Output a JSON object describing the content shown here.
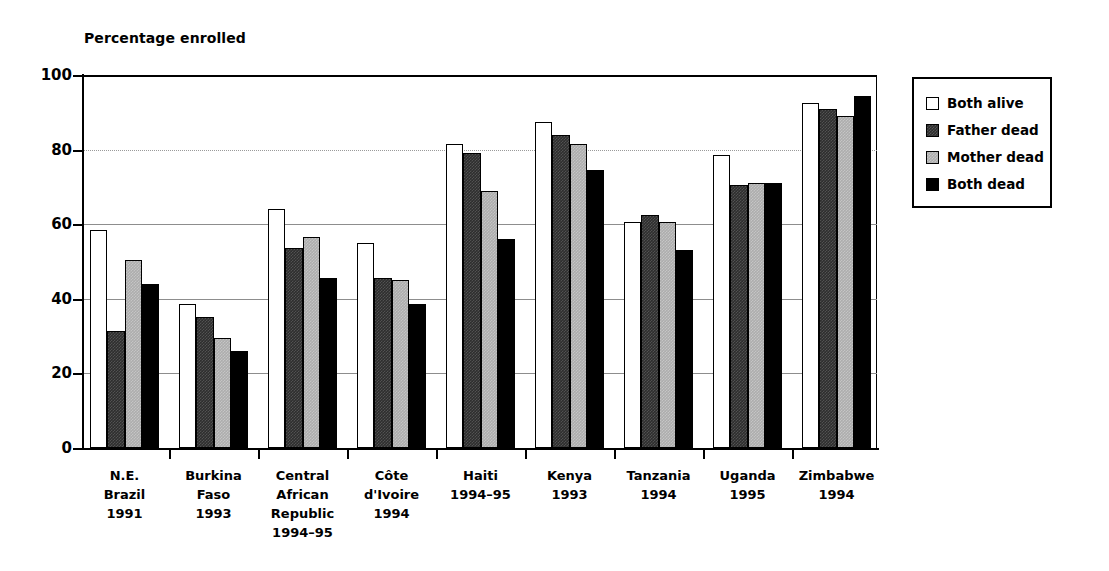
{
  "chart_data": {
    "type": "bar",
    "title": "",
    "ylabel": "Percentage enrolled",
    "xlabel": "",
    "ylim": [
      0,
      100
    ],
    "yticks": [
      0,
      20,
      40,
      60,
      80,
      100
    ],
    "grid": true,
    "legend_position": "right",
    "categories": [
      "N.E. Brazil 1991",
      "Burkina Faso 1993",
      "Central African Republic 1994–95",
      "Côte d'Ivoire 1994",
      "Haiti 1994–95",
      "Kenya 1993",
      "Tanzania 1994",
      "Uganda 1995",
      "Zimbabwe 1994"
    ],
    "category_lines": [
      [
        "N.E.",
        "Brazil",
        "1991"
      ],
      [
        "Burkina",
        "Faso",
        "1993"
      ],
      [
        "Central",
        "African",
        "Republic",
        "1994–95"
      ],
      [
        "Côte",
        "d'Ivoire",
        "1994"
      ],
      [
        "Haiti",
        "1994–95"
      ],
      [
        "Kenya",
        "1993"
      ],
      [
        "Tanzania",
        "1994"
      ],
      [
        "Uganda",
        "1995"
      ],
      [
        "Zimbabwe",
        "1994"
      ]
    ],
    "series": [
      {
        "name": "Both alive",
        "color": "#ffffff",
        "values": [
          58.5,
          38.5,
          64.0,
          55.0,
          81.5,
          87.5,
          60.5,
          78.5,
          92.5
        ]
      },
      {
        "name": "Father dead",
        "color": "#2e2e2e",
        "values": [
          31.5,
          35.0,
          53.5,
          45.5,
          79.0,
          84.0,
          62.5,
          70.5,
          91.0
        ]
      },
      {
        "name": "Mother dead",
        "color": "#adadad",
        "values": [
          50.5,
          29.5,
          56.5,
          45.0,
          69.0,
          81.5,
          60.5,
          71.0,
          89.0
        ]
      },
      {
        "name": "Both dead",
        "color": "#000000",
        "values": [
          44.0,
          26.0,
          45.5,
          38.5,
          56.0,
          74.5,
          53.0,
          71.0,
          94.5
        ]
      }
    ]
  },
  "legend": {
    "items": [
      {
        "label": "Both alive"
      },
      {
        "label": "Father dead"
      },
      {
        "label": "Mother dead"
      },
      {
        "label": "Both dead"
      }
    ]
  }
}
